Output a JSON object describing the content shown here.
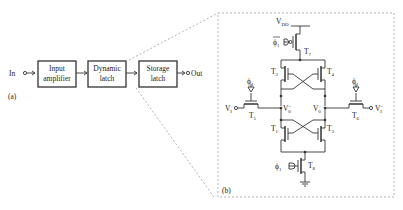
{
  "panel_a": {
    "label": "(a)",
    "input_label": "In",
    "output_label": "Out",
    "blocks": [
      {
        "line1": "Input",
        "line2": "amplifier"
      },
      {
        "line1": "Dynamic",
        "line2": "latch"
      },
      {
        "line1": "Storage",
        "line2": "latch"
      }
    ]
  },
  "panel_b": {
    "label": "(b)",
    "supply": "V",
    "supply_sub": "DD",
    "phi": "ϕ",
    "phi_sub": "1",
    "transistors": {
      "t1": "T",
      "t1_sub": "1",
      "t2": "T",
      "t2_sub": "2",
      "t3": "T",
      "t3_sub": "3",
      "t4": "T",
      "t4_sub": "4",
      "t5": "T",
      "t5_sub": "5",
      "t6": "T",
      "t6_sub": "6",
      "t7": "T",
      "t7_sub": "7",
      "t8": "T",
      "t8_sub": "8"
    },
    "nodes": {
      "vi_plus": "V",
      "vi_plus_sub": "I",
      "vi_plus_sup": "+",
      "vi_minus": "V",
      "vi_minus_sub": "I",
      "vi_minus_sup": "−",
      "vo_minus": "V",
      "vo_minus_sub": "0",
      "vo_minus_sup": "−",
      "vo_plus": "V",
      "vo_plus_sub": "0",
      "vo_plus_sup": "+"
    }
  },
  "colors": {
    "line": "#333333",
    "dashed": "#999999",
    "background": "#ffffff"
  }
}
